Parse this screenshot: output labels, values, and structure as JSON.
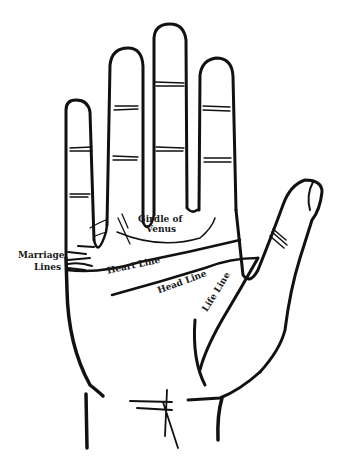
{
  "diagram": {
    "colors": {
      "ink": "#111111",
      "background": "#ffffff"
    },
    "labels": {
      "girdle_line1": "Girdle of",
      "girdle_line2": "Venus",
      "marriage_line1": "Marriage",
      "marriage_line2": "Lines",
      "heart": "Heart Line",
      "head": "Head Line",
      "life": "Life Line"
    }
  }
}
